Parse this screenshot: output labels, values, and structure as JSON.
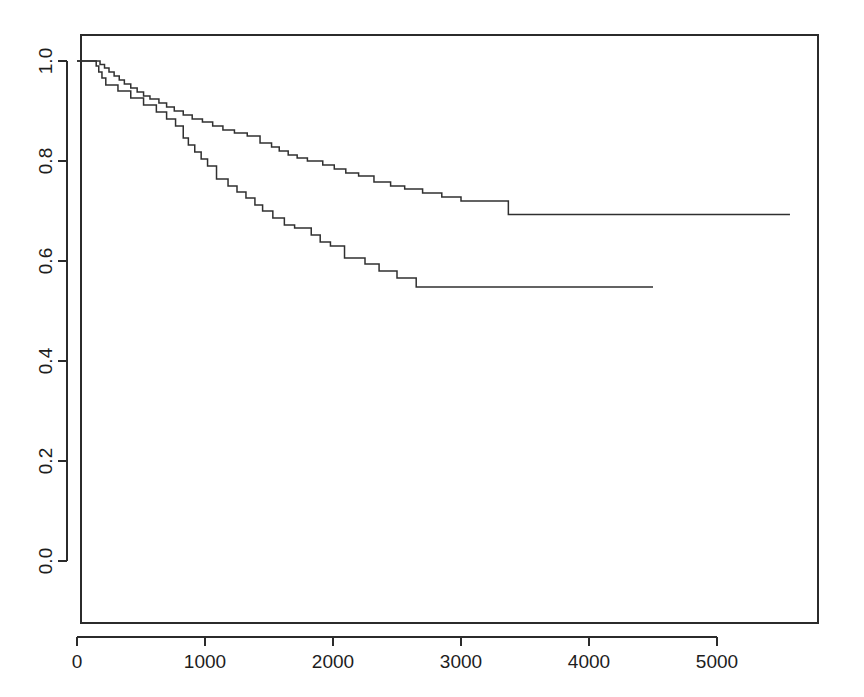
{
  "chart_data": {
    "type": "line",
    "subtype": "kaplan-meier-step",
    "title": "",
    "subtitle": "",
    "xlabel": "",
    "ylabel": "",
    "xlim": [
      0,
      5760
    ],
    "ylim": [
      0.0,
      1.0
    ],
    "grid": false,
    "legend": null,
    "legend_position": "none",
    "x_ticks": [
      0,
      1000,
      2000,
      3000,
      4000,
      5000
    ],
    "x_tick_labels": [
      "0",
      "1000",
      "2000",
      "3000",
      "4000",
      "5000"
    ],
    "y_ticks": [
      0.0,
      0.2,
      0.4,
      0.6,
      0.8,
      1.0
    ],
    "y_tick_labels": [
      "0.0",
      "0.2",
      "0.4",
      "0.6",
      "0.8",
      "1.0"
    ],
    "line_color": "#303030",
    "background_color": "#ffffff",
    "series": [
      {
        "name": "upper-curve",
        "final_survival": 0.693,
        "end_time": 5570,
        "steps": [
          [
            0,
            1.0
          ],
          [
            180,
            1.0
          ],
          [
            180,
            0.993
          ],
          [
            215,
            0.993
          ],
          [
            215,
            0.986
          ],
          [
            250,
            0.986
          ],
          [
            250,
            0.978
          ],
          [
            290,
            0.978
          ],
          [
            290,
            0.97
          ],
          [
            330,
            0.97
          ],
          [
            330,
            0.962
          ],
          [
            370,
            0.962
          ],
          [
            370,
            0.954
          ],
          [
            420,
            0.954
          ],
          [
            420,
            0.946
          ],
          [
            470,
            0.946
          ],
          [
            470,
            0.938
          ],
          [
            520,
            0.938
          ],
          [
            520,
            0.93
          ],
          [
            570,
            0.93
          ],
          [
            570,
            0.924
          ],
          [
            640,
            0.924
          ],
          [
            640,
            0.916
          ],
          [
            700,
            0.916
          ],
          [
            700,
            0.908
          ],
          [
            760,
            0.908
          ],
          [
            760,
            0.9
          ],
          [
            830,
            0.9
          ],
          [
            830,
            0.892
          ],
          [
            900,
            0.892
          ],
          [
            900,
            0.884
          ],
          [
            980,
            0.884
          ],
          [
            980,
            0.878
          ],
          [
            1060,
            0.878
          ],
          [
            1060,
            0.87
          ],
          [
            1140,
            0.87
          ],
          [
            1140,
            0.862
          ],
          [
            1230,
            0.862
          ],
          [
            1230,
            0.856
          ],
          [
            1330,
            0.856
          ],
          [
            1330,
            0.85
          ],
          [
            1430,
            0.85
          ],
          [
            1430,
            0.836
          ],
          [
            1520,
            0.836
          ],
          [
            1520,
            0.828
          ],
          [
            1580,
            0.828
          ],
          [
            1580,
            0.82
          ],
          [
            1650,
            0.82
          ],
          [
            1650,
            0.812
          ],
          [
            1720,
            0.812
          ],
          [
            1720,
            0.806
          ],
          [
            1800,
            0.806
          ],
          [
            1800,
            0.8
          ],
          [
            1920,
            0.8
          ],
          [
            1920,
            0.792
          ],
          [
            2010,
            0.792
          ],
          [
            2010,
            0.784
          ],
          [
            2100,
            0.784
          ],
          [
            2100,
            0.776
          ],
          [
            2200,
            0.776
          ],
          [
            2200,
            0.77
          ],
          [
            2320,
            0.77
          ],
          [
            2320,
            0.758
          ],
          [
            2450,
            0.758
          ],
          [
            2450,
            0.75
          ],
          [
            2560,
            0.75
          ],
          [
            2560,
            0.744
          ],
          [
            2700,
            0.744
          ],
          [
            2700,
            0.736
          ],
          [
            2850,
            0.736
          ],
          [
            2850,
            0.728
          ],
          [
            3000,
            0.728
          ],
          [
            3000,
            0.72
          ],
          [
            3370,
            0.72
          ],
          [
            3370,
            0.693
          ],
          [
            5570,
            0.693
          ]
        ]
      },
      {
        "name": "lower-curve",
        "final_survival": 0.548,
        "end_time": 4500,
        "steps": [
          [
            0,
            1.0
          ],
          [
            150,
            1.0
          ],
          [
            150,
            0.99
          ],
          [
            170,
            0.99
          ],
          [
            170,
            0.978
          ],
          [
            195,
            0.978
          ],
          [
            195,
            0.966
          ],
          [
            225,
            0.966
          ],
          [
            225,
            0.952
          ],
          [
            320,
            0.952
          ],
          [
            320,
            0.94
          ],
          [
            420,
            0.94
          ],
          [
            420,
            0.926
          ],
          [
            520,
            0.926
          ],
          [
            520,
            0.912
          ],
          [
            620,
            0.912
          ],
          [
            620,
            0.898
          ],
          [
            700,
            0.898
          ],
          [
            700,
            0.884
          ],
          [
            770,
            0.884
          ],
          [
            770,
            0.87
          ],
          [
            830,
            0.87
          ],
          [
            830,
            0.846
          ],
          [
            870,
            0.846
          ],
          [
            870,
            0.832
          ],
          [
            920,
            0.832
          ],
          [
            920,
            0.818
          ],
          [
            970,
            0.818
          ],
          [
            970,
            0.804
          ],
          [
            1020,
            0.804
          ],
          [
            1020,
            0.79
          ],
          [
            1090,
            0.79
          ],
          [
            1090,
            0.764
          ],
          [
            1180,
            0.764
          ],
          [
            1180,
            0.75
          ],
          [
            1250,
            0.75
          ],
          [
            1250,
            0.738
          ],
          [
            1320,
            0.738
          ],
          [
            1320,
            0.726
          ],
          [
            1390,
            0.726
          ],
          [
            1390,
            0.712
          ],
          [
            1450,
            0.712
          ],
          [
            1450,
            0.7
          ],
          [
            1530,
            0.7
          ],
          [
            1530,
            0.686
          ],
          [
            1620,
            0.686
          ],
          [
            1620,
            0.672
          ],
          [
            1700,
            0.672
          ],
          [
            1700,
            0.666
          ],
          [
            1830,
            0.666
          ],
          [
            1830,
            0.652
          ],
          [
            1900,
            0.652
          ],
          [
            1900,
            0.638
          ],
          [
            1980,
            0.638
          ],
          [
            1980,
            0.63
          ],
          [
            2090,
            0.63
          ],
          [
            2090,
            0.606
          ],
          [
            2250,
            0.606
          ],
          [
            2250,
            0.594
          ],
          [
            2360,
            0.594
          ],
          [
            2360,
            0.58
          ],
          [
            2500,
            0.58
          ],
          [
            2500,
            0.566
          ],
          [
            2650,
            0.566
          ],
          [
            2650,
            0.548
          ],
          [
            4500,
            0.548
          ]
        ]
      }
    ]
  },
  "axes": {
    "x_tick_labels": [
      "0",
      "1000",
      "2000",
      "3000",
      "4000",
      "5000"
    ],
    "y_tick_labels": [
      "0.0",
      "0.2",
      "0.4",
      "0.6",
      "0.8",
      "1.0"
    ]
  }
}
